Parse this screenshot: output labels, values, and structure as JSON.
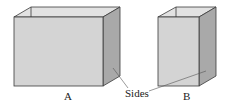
{
  "diagram": {
    "boxes": [
      {
        "id": "A",
        "label": "A"
      },
      {
        "id": "B",
        "label": "B"
      }
    ],
    "callout_label": "Sides",
    "colors": {
      "front_face": "#d4d4d4",
      "side_face": "#a9a9a9",
      "inner_back": "#e2e2e2",
      "edge": "#3a3a3a",
      "leader_line": "#555555"
    }
  }
}
